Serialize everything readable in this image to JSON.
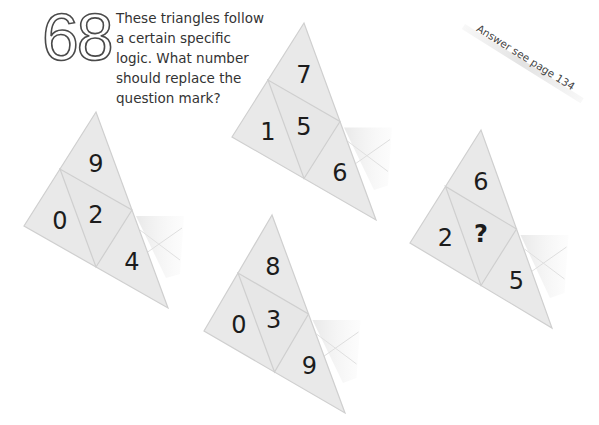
{
  "puzzle": {
    "number": "68",
    "question_lines": [
      "These triangles follow",
      "a certain specific",
      "logic. What number",
      "should replace the",
      "question mark?"
    ],
    "answer_note": "Answer see page 134"
  },
  "colors": {
    "triangle_fill": "#e9e9e9",
    "triangle_edge": "#cfcfcf",
    "digit": "#1c1c1c",
    "text": "#333333"
  },
  "triangles": [
    {
      "id": "triangle-top-center",
      "vertices": {
        "top": [
          304,
          23
        ],
        "left": [
          232,
          137
        ],
        "right": [
          376,
          220
        ]
      },
      "values": {
        "top": "7",
        "left": "1",
        "center": "5",
        "right": "6"
      }
    },
    {
      "id": "triangle-left",
      "vertices": {
        "top": [
          96,
          112
        ],
        "left": [
          24,
          226
        ],
        "right": [
          168,
          308
        ]
      },
      "values": {
        "top": "9",
        "left": "0",
        "center": "2",
        "right": "4"
      }
    },
    {
      "id": "triangle-bottom-center",
      "vertices": {
        "top": [
          272,
          215
        ],
        "left": [
          204,
          331
        ],
        "right": [
          345,
          413
        ]
      },
      "values": {
        "top": "8",
        "left": "0",
        "center": "3",
        "right": "9"
      }
    },
    {
      "id": "triangle-right",
      "vertices": {
        "top": [
          481,
          130
        ],
        "left": [
          410,
          243
        ],
        "right": [
          552,
          328
        ]
      },
      "values": {
        "top": "6",
        "left": "2",
        "center": "?",
        "right": "5"
      }
    }
  ]
}
